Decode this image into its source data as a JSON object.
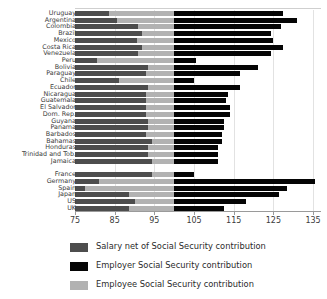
{
  "chart_data": {
    "type": "bar",
    "orientation": "horizontal",
    "stacked": true,
    "title": "",
    "subtitle": "",
    "xlabel": "",
    "ylabel": "",
    "xlim": [
      75,
      137
    ],
    "xticks": [
      75,
      85,
      95,
      105,
      115,
      125,
      135
    ],
    "xticklabels": [
      "75",
      "85",
      "95",
      "105",
      "115",
      "125",
      "135"
    ],
    "grid": true,
    "grid_axis": "x",
    "legend_position": "bottom-left",
    "baseline": 75,
    "series": [
      {
        "name": "Salary net of Social Security contribution",
        "color": "#4d4d4d",
        "values": [
          83.5,
          85.5,
          91.0,
          92.0,
          90.5,
          91.8,
          91.0,
          80.5,
          93.5,
          93.0,
          86.0,
          93.5,
          93.0,
          93.0,
          93.0,
          93.0,
          93.5,
          93.5,
          93.0,
          94.5,
          93.5,
          93.5,
          94.3,
          94.5,
          81.0,
          77.5,
          88.5,
          90.0,
          88.5,
          89.0
        ]
      },
      {
        "name": "Employee Social Security contribution",
        "color": "#b2b2b2",
        "values": [
          100.0,
          100.0,
          100.0,
          100.0,
          100.0,
          100.0,
          100.0,
          100.0,
          100.0,
          100.0,
          100.0,
          100.0,
          100.0,
          100.0,
          100.0,
          100.0,
          100.0,
          100.0,
          100.0,
          100.0,
          100.0,
          100.0,
          100.0,
          100.0,
          100.0,
          100.0,
          100.0,
          100.0,
          100.0,
          100.0
        ]
      },
      {
        "name": "Employer Social Security contribution",
        "color": "#050505",
        "values": [
          127.5,
          131.0,
          127.0,
          124.5,
          125.0,
          127.5,
          124.5,
          105.5,
          121.0,
          116.5,
          105.0,
          116.5,
          113.5,
          113.0,
          114.0,
          114.0,
          112.5,
          112.5,
          112.0,
          112.0,
          111.0,
          111.0,
          111.0,
          105.0,
          135.5,
          128.5,
          126.5,
          118.0,
          112.5,
          109.0
        ]
      }
    ],
    "categories": [
      "Uruguay",
      "Argentina",
      "Colombia",
      "Brazil",
      "Mexico",
      "Costa Rica",
      "Venezuela",
      "Peru",
      "Bolivia",
      "Paraguay",
      "Chile",
      "Ecuador",
      "Nicaragua",
      "Guatemala",
      "El Salvador",
      "Dom. Rep.",
      "Guyana",
      "Panama",
      "Barbados",
      "Bahamas",
      "Honduras",
      "Trinidad and Tob.",
      "Jamaica",
      "",
      "France",
      "Germany",
      "Spain",
      "Japan",
      "US",
      "UK"
    ],
    "groups": [
      {
        "name": "latin-america",
        "start": 0,
        "end": 22
      },
      {
        "name": "reference-countries",
        "start": 24,
        "end": 29
      }
    ]
  },
  "legend": {
    "items": [
      {
        "label": "Salary net of Social Security contribution",
        "color": "#4d4d4d",
        "icon": "legend-swatch-salary"
      },
      {
        "label": "Employer Social Security contribution",
        "color": "#050505",
        "icon": "legend-swatch-employer"
      },
      {
        "label": "Employee Social Security contribution",
        "color": "#b2b2b2",
        "icon": "legend-swatch-employee"
      }
    ]
  }
}
